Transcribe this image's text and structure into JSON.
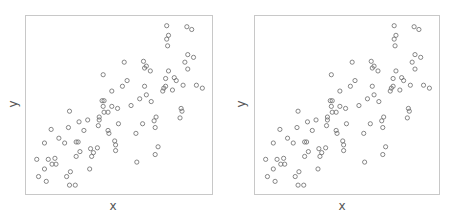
{
  "chart_data": [
    {
      "type": "scatter",
      "title": "",
      "xlabel": "x",
      "ylabel": "y",
      "grid": false,
      "legend": null,
      "xlim": [
        0,
        100
      ],
      "ylim": [
        0,
        100
      ],
      "marker": "open-circle",
      "marker_color": "#6a6a6a",
      "frame_color": "#c8c8c8",
      "points": [
        [
          76.5,
          96.1
        ],
        [
          87.7,
          95.5
        ],
        [
          90.4,
          93.9
        ],
        [
          77.5,
          90.5
        ],
        [
          76.5,
          88.3
        ],
        [
          77.0,
          84.4
        ],
        [
          88.2,
          79.3
        ],
        [
          91.4,
          77.7
        ],
        [
          86.6,
          74.9
        ],
        [
          88.2,
          70.9
        ],
        [
          77.5,
          69.8
        ],
        [
          52.9,
          74.9
        ],
        [
          63.6,
          75.4
        ],
        [
          65.2,
          72.6
        ],
        [
          64.2,
          71.5
        ],
        [
          67.4,
          69.8
        ],
        [
          41.2,
          67.6
        ],
        [
          54.5,
          64.2
        ],
        [
          51.9,
          60.9
        ],
        [
          64.2,
          60.9
        ],
        [
          75.9,
          65.4
        ],
        [
          80.7,
          65.9
        ],
        [
          81.8,
          64.2
        ],
        [
          85.6,
          61.5
        ],
        [
          93.0,
          61.5
        ],
        [
          96.3,
          59.8
        ],
        [
          75.9,
          60.9
        ],
        [
          74.9,
          59.8
        ],
        [
          74.3,
          58.1
        ],
        [
          79.7,
          58.7
        ],
        [
          46.0,
          58.1
        ],
        [
          65.2,
          55.9
        ],
        [
          61.5,
          53.6
        ],
        [
          67.9,
          52.0
        ],
        [
          40.6,
          52.5
        ],
        [
          41.7,
          52.5
        ],
        [
          41.2,
          49.2
        ],
        [
          46.0,
          49.2
        ],
        [
          49.2,
          48.0
        ],
        [
          56.7,
          49.7
        ],
        [
          41.7,
          45.8
        ],
        [
          43.9,
          45.8
        ],
        [
          22.5,
          46.4
        ],
        [
          39.0,
          43.0
        ],
        [
          39.0,
          41.3
        ],
        [
          84.5,
          48.0
        ],
        [
          85.0,
          46.4
        ],
        [
          83.9,
          42.5
        ],
        [
          70.6,
          43.0
        ],
        [
          69.5,
          40.8
        ],
        [
          70.1,
          36.9
        ],
        [
          63.1,
          39.1
        ],
        [
          49.7,
          39.1
        ],
        [
          32.6,
          41.3
        ],
        [
          27.8,
          40.2
        ],
        [
          21.9,
          36.9
        ],
        [
          30.5,
          35.2
        ],
        [
          38.5,
          38.0
        ],
        [
          12.3,
          35.8
        ],
        [
          43.9,
          35.2
        ],
        [
          44.4,
          33.5
        ],
        [
          59.4,
          33.5
        ],
        [
          16.6,
          30.7
        ],
        [
          8.6,
          27.9
        ],
        [
          19.8,
          27.9
        ],
        [
          26.2,
          28.5
        ],
        [
          27.3,
          28.5
        ],
        [
          47.6,
          29.1
        ],
        [
          48.1,
          26.8
        ],
        [
          48.1,
          23.5
        ],
        [
          71.7,
          25.7
        ],
        [
          38.0,
          25.1
        ],
        [
          34.2,
          24.6
        ],
        [
          28.3,
          22.9
        ],
        [
          35.8,
          22.3
        ],
        [
          34.8,
          20.1
        ],
        [
          26.2,
          20.1
        ],
        [
          70.1,
          21.2
        ],
        [
          4.3,
          18.4
        ],
        [
          10.7,
          18.4
        ],
        [
          14.4,
          19.0
        ],
        [
          12.8,
          15.6
        ],
        [
          15.0,
          15.6
        ],
        [
          59.9,
          16.8
        ],
        [
          8.6,
          12.8
        ],
        [
          23.0,
          11.2
        ],
        [
          33.7,
          12.8
        ],
        [
          5.3,
          8.4
        ],
        [
          20.9,
          8.4
        ],
        [
          9.6,
          5.6
        ],
        [
          22.5,
          3.4
        ],
        [
          25.7,
          3.4
        ]
      ]
    },
    {
      "type": "scatter",
      "title": "",
      "xlabel": "x",
      "ylabel": "y",
      "grid": false,
      "legend": null,
      "xlim": [
        0,
        100
      ],
      "ylim": [
        0,
        100
      ],
      "marker": "open-circle",
      "marker_color": "#6a6a6a",
      "frame_color": "#c8c8c8",
      "points_same_as": 0
    }
  ],
  "panels": [
    {
      "xlabel": "x",
      "ylabel": "y"
    },
    {
      "xlabel": "x",
      "ylabel": "y"
    }
  ]
}
